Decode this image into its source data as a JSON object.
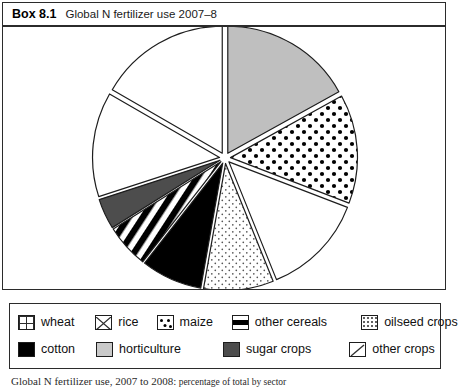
{
  "box": {
    "number": "Box 8.1",
    "title": "Global N fertilizer use 2007–8"
  },
  "caption": {
    "lead": "Global N fertilizer use, 2007 to 2008:",
    "rest": " percentage of total by sector"
  },
  "colors": {
    "outline": "#1d1d1d",
    "horticulture_fill": "#bfbfbf",
    "sugar_fill": "#4d4d4d",
    "cotton_fill": "#000000",
    "background": "#ffffff"
  },
  "legend": {
    "rows": [
      [
        {
          "label": "wheat",
          "pattern": "grid",
          "swatch_name": "legend-swatch-wheat"
        },
        {
          "label": "rice",
          "pattern": "zigzag",
          "swatch_name": "legend-swatch-rice"
        },
        {
          "label": "maize",
          "pattern": "dots-large",
          "swatch_name": "legend-swatch-maize"
        },
        {
          "label": "other cereals",
          "pattern": "stripes",
          "swatch_name": "legend-swatch-other-cereals"
        },
        {
          "label": "oilseed crops",
          "pattern": "dots-fine",
          "swatch_name": "legend-swatch-oilseed-crops"
        }
      ],
      [
        {
          "label": "cotton",
          "pattern": "solid-black",
          "swatch_name": "legend-swatch-cotton"
        },
        {
          "label": "horticulture",
          "pattern": "solid-grey",
          "swatch_name": "legend-swatch-horticulture"
        },
        {
          "label": "sugar crops",
          "pattern": "solid-darkgrey",
          "swatch_name": "legend-swatch-sugar-crops"
        },
        {
          "label": "other crops",
          "pattern": "diagonal",
          "swatch_name": "legend-swatch-other-crops"
        }
      ]
    ]
  },
  "chart_data": {
    "type": "pie",
    "title": "Global N fertilizer use 2007–8",
    "xlabel": "",
    "ylabel": "",
    "legend_position": "bottom",
    "exploded": true,
    "start_angle_deg": 0,
    "direction": "clockwise",
    "categories": [
      "horticulture",
      "maize",
      "rice",
      "oilseed crops",
      "cotton",
      "other cereals",
      "sugar crops",
      "other crops",
      "wheat"
    ],
    "values": [
      17,
      14,
      13,
      9,
      4,
      3,
      4,
      17,
      19
    ],
    "unit": "percent of total",
    "slices": [
      {
        "name": "horticulture",
        "value": 17,
        "pattern": "solid-grey",
        "start_deg": 0,
        "end_deg": 61
      },
      {
        "name": "maize",
        "value": 14,
        "pattern": "dots-large",
        "start_deg": 61,
        "end_deg": 111
      },
      {
        "name": "rice",
        "value": 13,
        "pattern": "zigzag",
        "start_deg": 111,
        "end_deg": 158
      },
      {
        "name": "oilseed crops",
        "value": 9,
        "pattern": "dots-fine",
        "start_deg": 158,
        "end_deg": 190
      },
      {
        "name": "cotton",
        "value": 4,
        "pattern": "solid-black",
        "start_deg": 190,
        "end_deg": 218
      },
      {
        "name": "other cereals",
        "value": 3,
        "pattern": "stripes",
        "start_deg": 218,
        "end_deg": 238
      },
      {
        "name": "sugar crops",
        "value": 4,
        "pattern": "solid-darkgrey",
        "start_deg": 238,
        "end_deg": 252
      },
      {
        "name": "other crops",
        "value": 17,
        "pattern": "diagonal",
        "start_deg": 252,
        "end_deg": 300
      },
      {
        "name": "wheat",
        "value": 19,
        "pattern": "grid",
        "start_deg": 300,
        "end_deg": 360
      }
    ]
  }
}
